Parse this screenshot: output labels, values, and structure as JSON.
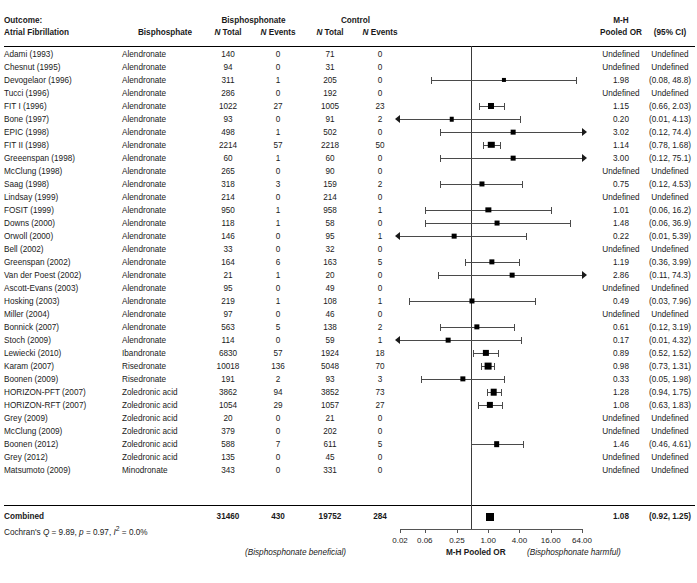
{
  "header": {
    "outcome_line1": "Outcome:",
    "outcome_line2": "Atrial Fibrillation",
    "bisphosphate_col": "Bisphosphate",
    "group_bisphosphonate": "Bisphosphonate",
    "group_control": "Control",
    "n_total": "N Total",
    "n_events": "N Events",
    "mh_line1": "M-H",
    "mh_line2": "Pooled OR",
    "ci_header": "(95% CI)"
  },
  "footer": {
    "left_label": "(Bisphosphonate beneficial)",
    "axis_title": "M-H Pooled OR",
    "right_label": "(Bisphosphonate harmful)",
    "combined_label": "Combined",
    "cochran": "Cochran's Q = 9.89, p = 0.97, I² = 0.0%"
  },
  "combined": {
    "b_total": "31460",
    "b_events": "430",
    "c_total": "19752",
    "c_events": "284",
    "or": "1.08",
    "ci": "(0.92, 1.25)"
  },
  "chart_data": {
    "type": "forest",
    "xlabel": "M-H Pooled OR",
    "xscale": "log",
    "xlim": [
      0.02,
      64.0
    ],
    "xticks": [
      0.02,
      0.06,
      0.25,
      1.0,
      4.0,
      16.0,
      64.0
    ],
    "xticklabels": [
      "0.02",
      "0.06",
      "0.25",
      "1.00",
      "4.00",
      "16.00",
      "64.00"
    ],
    "reference_line": 1.0,
    "grid": false,
    "left_annotation": "(Bisphosphonate beneficial)",
    "right_annotation": "(Bisphosphonate harmful)",
    "rows": [
      {
        "study": "Adami (1993)",
        "drug": "Alendronate",
        "b_total": "140",
        "b_events": "0",
        "c_total": "71",
        "c_events": "0",
        "or": "Undefined",
        "ci": "Undefined",
        "est": null,
        "lo": null,
        "hi": null,
        "weight": 0
      },
      {
        "study": "Chesnut (1995)",
        "drug": "Alendronate",
        "b_total": "94",
        "b_events": "0",
        "c_total": "31",
        "c_events": "0",
        "or": "Undefined",
        "ci": "Undefined",
        "est": null,
        "lo": null,
        "hi": null,
        "weight": 0
      },
      {
        "study": "Devogelaor (1996)",
        "drug": "Alendronate",
        "b_total": "311",
        "b_events": "1",
        "c_total": "205",
        "c_events": "0",
        "or": "1.98",
        "ci": "(0.08, 48.8)",
        "est": 1.98,
        "lo": 0.08,
        "hi": 48.8,
        "weight": 1.2
      },
      {
        "study": "Tucci (1996)",
        "drug": "Alendronate",
        "b_total": "286",
        "b_events": "0",
        "c_total": "192",
        "c_events": "0",
        "or": "Undefined",
        "ci": "Undefined",
        "est": null,
        "lo": null,
        "hi": null,
        "weight": 0
      },
      {
        "study": "FIT I (1996)",
        "drug": "Alendronate",
        "b_total": "1022",
        "b_events": "27",
        "c_total": "1005",
        "c_events": "23",
        "or": "1.15",
        "ci": "(0.66, 2.03)",
        "est": 1.15,
        "lo": 0.66,
        "hi": 2.03,
        "weight": 3.2
      },
      {
        "study": "Bone (1997)",
        "drug": "Alendronate",
        "b_total": "93",
        "b_events": "0",
        "c_total": "91",
        "c_events": "2",
        "or": "0.20",
        "ci": "(0.01, 4.13)",
        "est": 0.2,
        "lo": 0.01,
        "hi": 4.13,
        "weight": 1.6
      },
      {
        "study": "EPIC (1998)",
        "drug": "Alendronate",
        "b_total": "498",
        "b_events": "1",
        "c_total": "502",
        "c_events": "0",
        "or": "3.02",
        "ci": "(0.12, 74.4)",
        "est": 3.02,
        "lo": 0.12,
        "hi": 74.4,
        "weight": 1.8
      },
      {
        "study": "FIT II (1998)",
        "drug": "Alendronate",
        "b_total": "2214",
        "b_events": "57",
        "c_total": "2218",
        "c_events": "50",
        "or": "1.14",
        "ci": "(0.78, 1.68)",
        "est": 1.14,
        "lo": 0.78,
        "hi": 1.68,
        "weight": 3.6
      },
      {
        "study": "Greeenspan (1998)",
        "drug": "Alendronate",
        "b_total": "60",
        "b_events": "1",
        "c_total": "60",
        "c_events": "0",
        "or": "3.00",
        "ci": "(0.12, 75.1)",
        "est": 3.0,
        "lo": 0.12,
        "hi": 75.1,
        "weight": 1.8
      },
      {
        "study": "McClung (1998)",
        "drug": "Alendronate",
        "b_total": "265",
        "b_events": "0",
        "c_total": "90",
        "c_events": "0",
        "or": "Undefined",
        "ci": "Undefined",
        "est": null,
        "lo": null,
        "hi": null,
        "weight": 0
      },
      {
        "study": "Saag (1998)",
        "drug": "Alendronate",
        "b_total": "318",
        "b_events": "3",
        "c_total": "159",
        "c_events": "2",
        "or": "0.75",
        "ci": "(0.12, 4.53)",
        "est": 0.75,
        "lo": 0.12,
        "hi": 4.53,
        "weight": 2.2
      },
      {
        "study": "Lindsay (1999)",
        "drug": "Alendronate",
        "b_total": "214",
        "b_events": "0",
        "c_total": "214",
        "c_events": "0",
        "or": "Undefined",
        "ci": "Undefined",
        "est": null,
        "lo": null,
        "hi": null,
        "weight": 0
      },
      {
        "study": "FOSIT (1999)",
        "drug": "Alendronate",
        "b_total": "950",
        "b_events": "1",
        "c_total": "958",
        "c_events": "1",
        "or": "1.01",
        "ci": "(0.06, 16.2)",
        "est": 1.01,
        "lo": 0.06,
        "hi": 16.2,
        "weight": 2.4
      },
      {
        "study": "Downs (2000)",
        "drug": "Alendronate",
        "b_total": "118",
        "b_events": "1",
        "c_total": "58",
        "c_events": "0",
        "or": "1.48",
        "ci": "(0.06, 36.9)",
        "est": 1.48,
        "lo": 0.06,
        "hi": 36.9,
        "weight": 2.0
      },
      {
        "study": "Orwoll (2000)",
        "drug": "Alendronate",
        "b_total": "146",
        "b_events": "0",
        "c_total": "95",
        "c_events": "1",
        "or": "0.22",
        "ci": "(0.01, 5.39)",
        "est": 0.22,
        "lo": 0.01,
        "hi": 5.39,
        "weight": 1.8
      },
      {
        "study": "Bell (2002)",
        "drug": "Alendronate",
        "b_total": "33",
        "b_events": "0",
        "c_total": "32",
        "c_events": "0",
        "or": "Undefined",
        "ci": "Undefined",
        "est": null,
        "lo": null,
        "hi": null,
        "weight": 0
      },
      {
        "study": "Greenspan (2002)",
        "drug": "Alendronate",
        "b_total": "164",
        "b_events": "6",
        "c_total": "163",
        "c_events": "5",
        "or": "1.19",
        "ci": "(0.36, 3.99)",
        "est": 1.19,
        "lo": 0.36,
        "hi": 3.99,
        "weight": 2.4
      },
      {
        "study": "Van der Poest (2002)",
        "drug": "Alendronate",
        "b_total": "21",
        "b_events": "1",
        "c_total": "20",
        "c_events": "0",
        "or": "2.86",
        "ci": "(0.11, 74.3)",
        "est": 2.86,
        "lo": 0.11,
        "hi": 74.3,
        "weight": 1.8
      },
      {
        "study": "Ascott-Evans (2003)",
        "drug": "Alendronate",
        "b_total": "95",
        "b_events": "0",
        "c_total": "49",
        "c_events": "0",
        "or": "Undefined",
        "ci": "Undefined",
        "est": null,
        "lo": null,
        "hi": null,
        "weight": 0
      },
      {
        "study": "Hosking (2003)",
        "drug": "Alendronate",
        "b_total": "219",
        "b_events": "1",
        "c_total": "108",
        "c_events": "1",
        "or": "0.49",
        "ci": "(0.03, 7.96)",
        "est": 0.49,
        "lo": 0.03,
        "hi": 7.96,
        "weight": 2.2
      },
      {
        "study": "Miller (2004)",
        "drug": "Alendronate",
        "b_total": "97",
        "b_events": "0",
        "c_total": "46",
        "c_events": "0",
        "or": "Undefined",
        "ci": "Undefined",
        "est": null,
        "lo": null,
        "hi": null,
        "weight": 0
      },
      {
        "study": "Bonnick (2007)",
        "drug": "Alendronate",
        "b_total": "563",
        "b_events": "5",
        "c_total": "138",
        "c_events": "2",
        "or": "0.61",
        "ci": "(0.12, 3.19)",
        "est": 0.61,
        "lo": 0.12,
        "hi": 3.19,
        "weight": 2.4
      },
      {
        "study": "Stoch (2009)",
        "drug": "Alendronate",
        "b_total": "114",
        "b_events": "0",
        "c_total": "59",
        "c_events": "1",
        "or": "0.17",
        "ci": "(0.01, 4.32)",
        "est": 0.17,
        "lo": 0.01,
        "hi": 4.32,
        "weight": 1.8
      },
      {
        "study": "Lewiecki (2010)",
        "drug": "Ibandronate",
        "b_total": "6830",
        "b_events": "57",
        "c_total": "1924",
        "c_events": "18",
        "or": "0.89",
        "ci": "(0.52, 1.52)",
        "est": 0.89,
        "lo": 0.52,
        "hi": 1.52,
        "weight": 3.4
      },
      {
        "study": "Karam (2007)",
        "drug": "Risedronate",
        "b_total": "10018",
        "b_events": "136",
        "c_total": "5048",
        "c_events": "70",
        "or": "0.98",
        "ci": "(0.73, 1.31)",
        "est": 0.98,
        "lo": 0.73,
        "hi": 1.31,
        "weight": 4.0
      },
      {
        "study": "Boonen (2009)",
        "drug": "Risedronate",
        "b_total": "191",
        "b_events": "2",
        "c_total": "93",
        "c_events": "3",
        "or": "0.33",
        "ci": "(0.05, 1.98)",
        "est": 0.33,
        "lo": 0.05,
        "hi": 1.98,
        "weight": 2.4
      },
      {
        "study": "HORIZON-PFT (2007)",
        "drug": "Zoledronic acid",
        "b_total": "3862",
        "b_events": "94",
        "c_total": "3852",
        "c_events": "73",
        "or": "1.28",
        "ci": "(0.94, 1.75)",
        "est": 1.28,
        "lo": 0.94,
        "hi": 1.75,
        "weight": 3.8
      },
      {
        "study": "HORIZON-RFT (2007)",
        "drug": "Zoledronic acid",
        "b_total": "1054",
        "b_events": "29",
        "c_total": "1057",
        "c_events": "27",
        "or": "1.08",
        "ci": "(0.63, 1.83)",
        "est": 1.08,
        "lo": 0.63,
        "hi": 1.83,
        "weight": 3.4
      },
      {
        "study": "Grey (2009)",
        "drug": "Zoledronic acid",
        "b_total": "20",
        "b_events": "0",
        "c_total": "21",
        "c_events": "0",
        "or": "Undefined",
        "ci": "Undefined",
        "est": null,
        "lo": null,
        "hi": null,
        "weight": 0
      },
      {
        "study": "McClung (2009)",
        "drug": "Zoledronic acid",
        "b_total": "379",
        "b_events": "0",
        "c_total": "202",
        "c_events": "0",
        "or": "Undefined",
        "ci": "Undefined",
        "est": null,
        "lo": null,
        "hi": null,
        "weight": 0
      },
      {
        "study": "Boonen (2012)",
        "drug": "Zoledronic acid",
        "b_total": "588",
        "b_events": "7",
        "c_total": "611",
        "c_events": "5",
        "or": "1.46",
        "ci": "(0.46, 4.61)",
        "est": 1.46,
        "lo": 0.46,
        "hi": 4.61,
        "weight": 2.8
      },
      {
        "study": "Grey (2012)",
        "drug": "Zoledronic acid",
        "b_total": "135",
        "b_events": "0",
        "c_total": "45",
        "c_events": "0",
        "or": "Undefined",
        "ci": "Undefined",
        "est": null,
        "lo": null,
        "hi": null,
        "weight": 0
      },
      {
        "study": "Matsumoto (2009)",
        "drug": "Minodronate",
        "b_total": "343",
        "b_events": "0",
        "c_total": "331",
        "c_events": "0",
        "or": "Undefined",
        "ci": "Undefined",
        "est": null,
        "lo": null,
        "hi": null,
        "weight": 0
      }
    ],
    "summary": {
      "label": "Combined",
      "est": 1.08,
      "lo": 0.92,
      "hi": 1.25,
      "or": "1.08",
      "ci": "(0.92, 1.25)"
    }
  }
}
